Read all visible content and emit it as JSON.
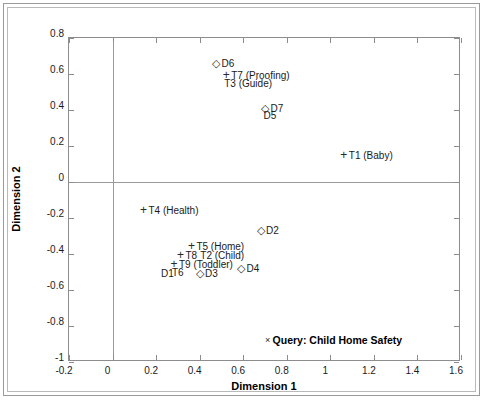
{
  "chart_data": {
    "type": "scatter",
    "title": "",
    "xlabel": "Dimension 1",
    "ylabel": "Dimension 2",
    "xlim": [
      -0.2,
      1.6
    ],
    "ylim": [
      -1,
      0.8
    ],
    "xticks": [
      "-0.2",
      "0",
      "0.2",
      "0.4",
      "0.6",
      "0.8",
      "1",
      "1.2",
      "1.4",
      "1.6"
    ],
    "xtick_values": [
      -0.2,
      0,
      0.2,
      0.4,
      0.6,
      0.8,
      1.0,
      1.2,
      1.4,
      1.6
    ],
    "yticks": [
      "0.8",
      "0.6",
      "0.4",
      "0.2",
      "0",
      "-0.2",
      "-0.4",
      "-0.6",
      "-0.8",
      "-1"
    ],
    "ytick_values": [
      0.8,
      0.6,
      0.4,
      0.2,
      0,
      -0.2,
      -0.4,
      -0.6,
      -0.8,
      -1
    ],
    "grid": false,
    "zero_lines": true,
    "legend": "none",
    "series": [
      {
        "name": "Documents",
        "marker": "diamond",
        "marker_glyph": "◇",
        "points": [
          {
            "label": "D6",
            "x": 0.5,
            "y": 0.635,
            "label_pos": "right"
          },
          {
            "label": "D7",
            "x": 0.725,
            "y": 0.385,
            "label_pos": "right"
          },
          {
            "label": "D5",
            "x": 0.725,
            "y": 0.345,
            "label_pos": "below"
          },
          {
            "label": "D2",
            "x": 0.705,
            "y": -0.295,
            "label_pos": "right"
          },
          {
            "label": "D4",
            "x": 0.615,
            "y": -0.505,
            "label_pos": "right"
          },
          {
            "label": "D3",
            "x": 0.425,
            "y": -0.535,
            "label_pos": "right"
          },
          {
            "label": "D1",
            "x": 0.255,
            "y": -0.535,
            "label_pos": "below"
          }
        ]
      },
      {
        "name": "Terms",
        "marker": "plus",
        "marker_glyph": "+",
        "points": [
          {
            "label": "T7 (Proofing)",
            "x": 0.545,
            "y": 0.565,
            "label_pos": "right"
          },
          {
            "label": "T3 (Guide)",
            "x": 0.545,
            "y": 0.52,
            "label_pos": "below"
          },
          {
            "label": "T1 (Baby)",
            "x": 1.085,
            "y": 0.125,
            "label_pos": "right"
          },
          {
            "label": "T4 (Health)",
            "x": 0.165,
            "y": -0.185,
            "label_pos": "right"
          },
          {
            "label": "T5 (Home)",
            "x": 0.385,
            "y": -0.385,
            "label_pos": "right"
          },
          {
            "label": "T8",
            "x": 0.335,
            "y": -0.435,
            "label_pos": "right"
          },
          {
            "label": "T2 (Child)",
            "x": 0.435,
            "y": -0.435,
            "label_pos": "below"
          },
          {
            "label": "T9 (Toddler)",
            "x": 0.305,
            "y": -0.485,
            "label_pos": "right"
          },
          {
            "label": "T6",
            "x": 0.305,
            "y": -0.525,
            "label_pos": "below"
          }
        ]
      },
      {
        "name": "Query",
        "marker": "x",
        "marker_glyph": "×",
        "points": [
          {
            "label": "Query: Child Home Safety",
            "x": 0.735,
            "y": -0.905,
            "label_pos": "right",
            "bold": true
          }
        ]
      }
    ]
  }
}
